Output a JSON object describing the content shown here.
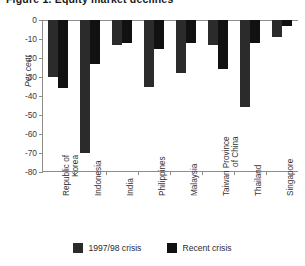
{
  "chart_data": {
    "type": "bar",
    "title": "Figure 1. Equity market declines",
    "ylabel": "Per cent",
    "xlabel": "",
    "ylim": [
      -80,
      0
    ],
    "ytick_values": [
      0,
      -10,
      -20,
      -30,
      -40,
      -50,
      -60,
      -70,
      -80
    ],
    "ytick_labels": [
      "0",
      "-10",
      "-20",
      "-30",
      "-40",
      "-50",
      "-60",
      "-70",
      "-80"
    ],
    "grid": false,
    "legend_position": "bottom",
    "categories": [
      "Republic of Korea",
      "Indonesia",
      "India",
      "Philippines",
      "Malaysia",
      "Taiwan Province of China",
      "Thailand",
      "Singapore"
    ],
    "category_lines": [
      [
        "Republic of",
        "Korea"
      ],
      [
        "Indonesia"
      ],
      [
        "India"
      ],
      [
        "Philippines"
      ],
      [
        "Malaysia"
      ],
      [
        "Taiwan Province",
        "of China"
      ],
      [
        "Thailand"
      ],
      [
        "Singapore"
      ]
    ],
    "series": [
      {
        "name": "1997/98 crisis",
        "color": "#2b2b2b",
        "values": [
          -30,
          -70,
          -13,
          -35,
          -28,
          -13,
          -46,
          -9
        ]
      },
      {
        "name": "Recent crisis",
        "color": "#111111",
        "values": [
          -36,
          -23,
          -12,
          -15,
          -12,
          -26,
          -12,
          -3
        ]
      }
    ]
  }
}
